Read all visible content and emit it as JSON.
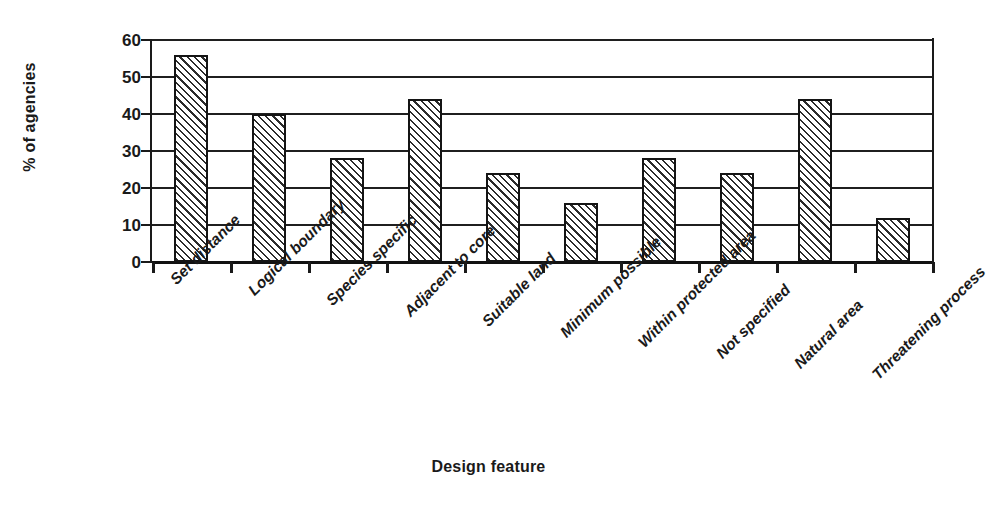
{
  "chart_data": {
    "type": "bar",
    "title": "",
    "xlabel": "Design feature",
    "ylabel": "% of agencies",
    "categories": [
      "Set distance",
      "Logical boundary",
      "Species specific",
      "Adjacent to core",
      "Suitable land",
      "Minimum possible",
      "Within protected area",
      "Not specified",
      "Natural area",
      "Threatening process"
    ],
    "values": [
      56,
      40,
      28,
      44,
      24,
      16,
      28,
      24,
      44,
      12
    ],
    "ylim": [
      0,
      60
    ],
    "y_ticks": [
      0,
      10,
      20,
      30,
      40,
      50,
      60
    ],
    "y_tick_labels": [
      "0",
      "10",
      "20",
      "30",
      "40",
      "50",
      "60"
    ],
    "grid": "horizontal",
    "legend": "none",
    "bar_fill": "diagonal-hatch",
    "colors": {
      "ink": "#1a1a1a",
      "bar_border": "#141414",
      "bar_hatch": "#2b2b2b",
      "bar_background": "#ffffff",
      "gridline": "#1f1f1f",
      "page_background": "#ffffff"
    }
  },
  "axes": {
    "y_title": "% of agencies",
    "x_title": "Design feature"
  }
}
